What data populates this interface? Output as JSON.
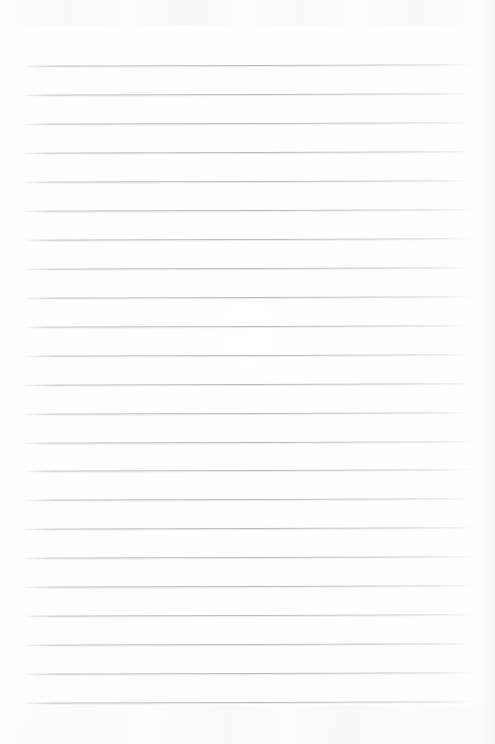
{
  "document": {
    "type": "scanned-lined-paper",
    "title": "Blank ruled notebook page",
    "text_content": "",
    "handwriting_present": false,
    "page_width": 495,
    "page_height": 744,
    "background_color": "#fefeff",
    "rule_color": "#bababf",
    "margins": {
      "top": 65,
      "bottom": 42,
      "left": 22,
      "right": 23
    },
    "ruling": {
      "line_count": 23,
      "first_line_y": 65,
      "last_line_y": 702,
      "line_spacing": 28.95,
      "line_start_x": 22,
      "line_end_x": 472,
      "line_thickness": 1,
      "skew_degrees": -0.16,
      "has_vertical_margin_rule": false,
      "line_y_positions": [
        65,
        94,
        123,
        152,
        181,
        210,
        239,
        268,
        297,
        326,
        355,
        384,
        413,
        442,
        470,
        499,
        528,
        557,
        586,
        615,
        644,
        673,
        702
      ]
    }
  }
}
